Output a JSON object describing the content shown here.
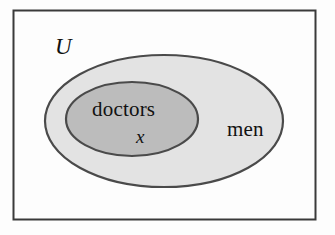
{
  "diagram": {
    "type": "euler-diagram",
    "title_visible": false,
    "frame": {
      "name": "universe-rectangle",
      "stroke_color": "#3a3a3a",
      "fill_color": "#fdfdfd",
      "x": 13,
      "y": 10,
      "width": 303,
      "height": 210
    },
    "sets": [
      {
        "id": "men",
        "label": "men",
        "shape": "ellipse",
        "fill_color": "#e3e3e3",
        "stroke_color": "#4a4a4a",
        "cx": 164,
        "cy": 121,
        "rx": 119,
        "ry": 66,
        "label_x": 244,
        "label_y": 130
      },
      {
        "id": "doctors",
        "label": "doctors",
        "shape": "ellipse",
        "fill_color": "#bcbcbc",
        "stroke_color": "#4a4a4a",
        "cx": 132,
        "cy": 119,
        "rx": 66,
        "ry": 37,
        "label_x": 129,
        "label_y": 110
      }
    ],
    "labels": {
      "universe": "U",
      "outer_set": "men",
      "inner_set": "doctors",
      "element": "x"
    },
    "element_point": {
      "name": "element-x",
      "label": "x",
      "inside_set": "doctors",
      "x": 142,
      "y": 136
    },
    "colors": {
      "background": "#fdfdfd",
      "frame_stroke": "#3a3a3a",
      "outer_fill": "#e3e3e3",
      "inner_fill": "#bcbcbc",
      "ellipse_stroke": "#4a4a4a",
      "text": "#111111"
    }
  }
}
